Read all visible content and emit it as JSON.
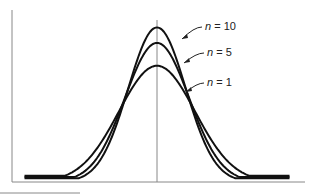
{
  "chart_data": {
    "type": "line",
    "title": "",
    "xlabel": "",
    "ylabel": "",
    "grid": false,
    "xlim": [
      -4,
      4
    ],
    "ylim": [
      0,
      0.55
    ],
    "center_line_x": 0,
    "series": [
      {
        "name": "n = 10",
        "label_var": "n",
        "label_value": "10",
        "peak": 0.5,
        "sigma": 0.8
      },
      {
        "name": "n = 5",
        "label_var": "n",
        "label_value": "5",
        "peak": 0.45,
        "sigma": 0.89
      },
      {
        "name": "n = 1",
        "label_var": "n",
        "label_value": "1",
        "peak": 0.376,
        "sigma": 1.06
      }
    ],
    "annotations": [
      {
        "text": "n = 10",
        "points_to": "n = 10"
      },
      {
        "text": "n = 5",
        "points_to": "n = 5"
      },
      {
        "text": "n = 1",
        "points_to": "n = 1"
      }
    ]
  }
}
